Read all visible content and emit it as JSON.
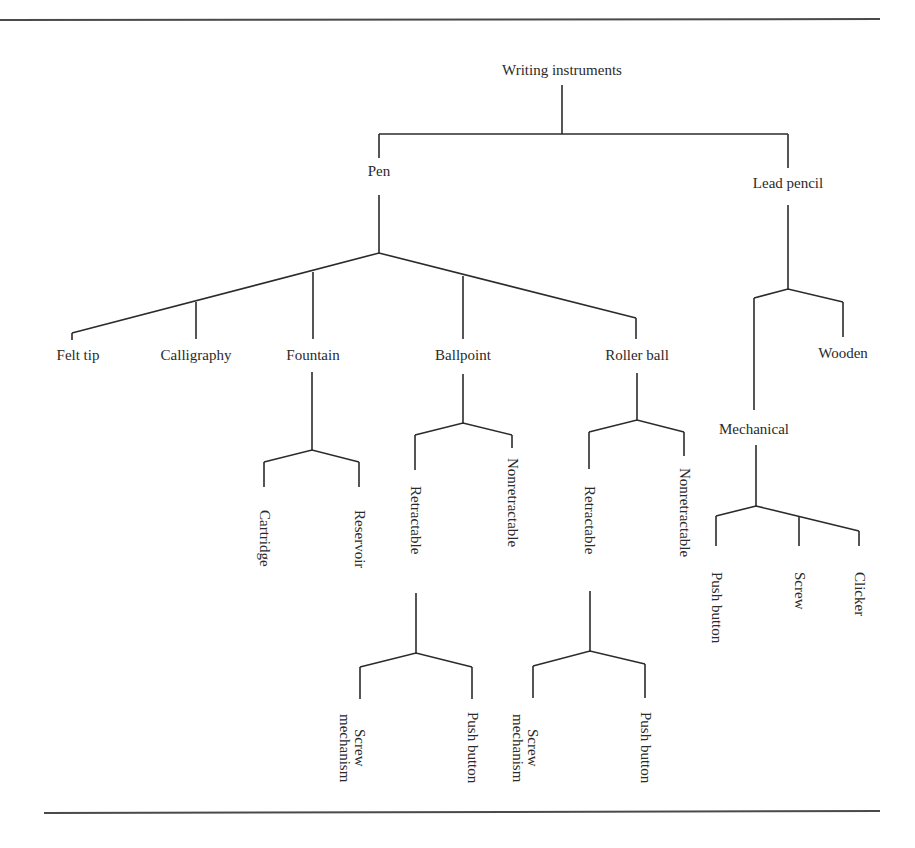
{
  "header": {
    "rule_color": "#4a4a4a"
  },
  "tree": {
    "root": "Writing instruments",
    "pen": {
      "label": "Pen",
      "children": [
        "Felt tip",
        "Calligraphy",
        "Fountain",
        "Ballpoint",
        "Roller ball"
      ],
      "fountain": [
        "Cartridge",
        "Reservoir"
      ],
      "ballpoint": [
        "Retractable",
        "Nonretractable"
      ],
      "ballpoint_retractable": [
        "Screw\nmechanism",
        "Push button"
      ],
      "ballpoint_retractable_lines": [
        "Screw",
        "mechanism"
      ],
      "rollerball": [
        "Retractable",
        "Nonretractable"
      ],
      "rollerball_retractable_lines": [
        "Screw",
        "mechanism"
      ],
      "rollerball_push": "Push button",
      "ballpoint_push": "Push button"
    },
    "lead_pencil": {
      "label": "Lead pencil",
      "children": [
        "Mechanical",
        "Wooden"
      ],
      "mechanical": [
        "Push button",
        "Screw",
        "Clicker"
      ]
    }
  },
  "colors": {
    "line": "#2b2b2b",
    "text": "#2a2a2a",
    "background": "#ffffff"
  }
}
